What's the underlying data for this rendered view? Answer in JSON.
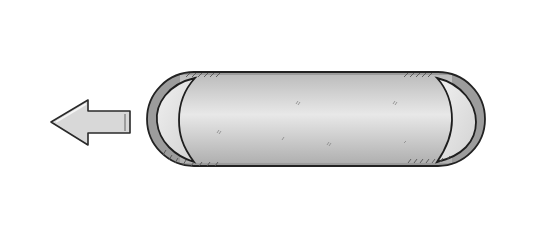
{
  "diagram": {
    "direction_arrow": "left",
    "colors": {
      "magnet_fill": "#a9a9a9",
      "magnet_stroke": "#2a2a2a",
      "shell_fill": "#9c9c9c",
      "body_light": "#e6e6e6",
      "body_dark": "#b4b4b4",
      "glare": "#e2e2e2",
      "arrow_fill": "#d6d6d6",
      "line": "#1a1a1a"
    },
    "top_track": {
      "y": 19,
      "height": 19,
      "magnets": [
        {
          "x": 31,
          "w": 79,
          "label": "S"
        },
        {
          "x": 111,
          "w": 79,
          "label": "N"
        },
        {
          "x": 191,
          "w": 80,
          "label": "S"
        },
        {
          "x": 272,
          "w": 80,
          "label": "N"
        },
        {
          "x": 353,
          "w": 79,
          "label": "S"
        },
        {
          "x": 433,
          "w": 78,
          "label": "N"
        }
      ]
    },
    "bottom_track": {
      "y": 205,
      "height": 19,
      "magnets": [
        {
          "x": 31,
          "w": 79,
          "label": "N"
        },
        {
          "x": 111,
          "w": 79,
          "label": "S"
        },
        {
          "x": 191,
          "w": 80,
          "label": "N"
        },
        {
          "x": 272,
          "w": 80,
          "label": "S"
        },
        {
          "x": 353,
          "w": 79,
          "label": "N"
        },
        {
          "x": 433,
          "w": 78,
          "label": "S"
        }
      ]
    },
    "vehicle": {
      "x": 147,
      "y": 72,
      "w": 338,
      "h": 94,
      "top_magnets": [
        {
          "x": 229,
          "y": 71,
          "w": 83,
          "h": 17,
          "label": "N"
        },
        {
          "x": 313,
          "y": 71,
          "w": 85,
          "h": 17,
          "label": "S"
        }
      ],
      "bottom_magnets": [
        {
          "x": 229,
          "y": 154,
          "w": 83,
          "h": 18,
          "label": "S"
        },
        {
          "x": 314,
          "y": 154,
          "w": 86,
          "h": 18,
          "label": "N"
        }
      ]
    },
    "field_lines": [
      {
        "from": [
          271,
          70
        ],
        "to": [
          231,
          38
        ],
        "arrow_toward": "to"
      },
      {
        "from": [
          316,
          38
        ],
        "to": [
          271,
          70
        ],
        "arrow_toward": "to"
      },
      {
        "from": [
          359,
          70
        ],
        "to": [
          316,
          38
        ],
        "arrow_toward": "to"
      },
      {
        "from": [
          398,
          38
        ],
        "to": [
          359,
          70
        ],
        "arrow_toward": "to"
      },
      {
        "from": [
          271,
          172
        ],
        "to": [
          232,
          205
        ],
        "arrow_toward": "to"
      },
      {
        "from": [
          312,
          205
        ],
        "to": [
          271,
          172
        ],
        "arrow_toward": "to"
      },
      {
        "from": [
          359,
          172
        ],
        "to": [
          312,
          205
        ],
        "arrow_toward": "to"
      },
      {
        "from": [
          398,
          205
        ],
        "to": [
          359,
          172
        ],
        "arrow_toward": "to"
      }
    ]
  }
}
